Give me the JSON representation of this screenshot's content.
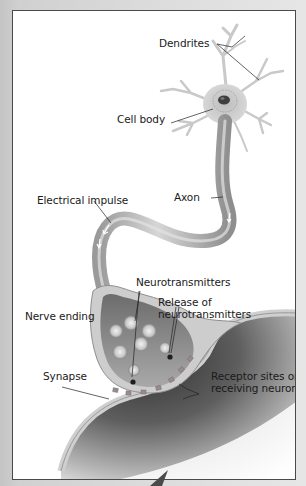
{
  "figure": {
    "type": "neuron-anatomy-illustration",
    "labels": {
      "dendrites": "Dendrites",
      "cell_body": "Cell body",
      "axon": "Axon",
      "electrical_impulse": "Electrical impulse",
      "neurotransmitters": "Neurotransmitters",
      "release_line1": "Release of",
      "release_line2": "neurotransmitters",
      "nerve_ending": "Nerve ending",
      "synapse": "Synapse",
      "receptor_line1": "Receptor sites on",
      "receptor_line2": "receiving neuron"
    },
    "colors": {
      "frame_border": "#4a4a4a",
      "neuron_fill": "#c8c8c8",
      "neuron_dark": "#8a8a8a",
      "receiving_neuron": "#5a5a5a",
      "background": "#ffffff",
      "outside": "#cccccc"
    }
  }
}
